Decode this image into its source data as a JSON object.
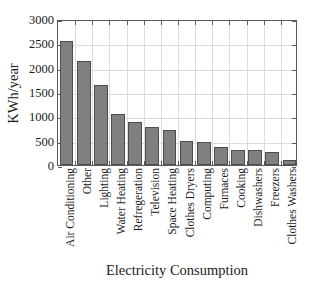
{
  "chart_data": {
    "type": "bar",
    "title": "",
    "xlabel": "Electricity Consumption",
    "ylabel": "KWh/year",
    "categories": [
      "Air Conditioning",
      "Other",
      "Lighting",
      "Water Heating",
      "Refregeration",
      "Television",
      "Space Heating",
      "Clothes Dryers",
      "Computing",
      "Furnaces",
      "Cooking",
      "Dishwashers",
      "Freezers",
      "Clothes Washers"
    ],
    "values": [
      2540,
      2130,
      1640,
      1055,
      880,
      780,
      710,
      490,
      480,
      370,
      310,
      300,
      265,
      105
    ],
    "ylim": [
      0,
      3000
    ],
    "yticks": [
      0,
      500,
      1000,
      1500,
      2000,
      2500,
      3000
    ],
    "ytick_labels": [
      "0",
      "500",
      "1000",
      "1500",
      "2000",
      "2500",
      "3000"
    ],
    "grid": true,
    "legend": null,
    "bar_color": "#808080",
    "bar_edge_color": "#4d4d4d",
    "axis_color": "#595959",
    "grid_color": "#dcdcdc"
  }
}
